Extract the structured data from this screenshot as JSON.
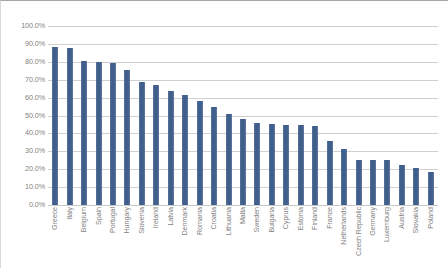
{
  "chart_data": {
    "type": "bar",
    "title": "",
    "subtitle": "",
    "xlabel": "",
    "ylabel": "",
    "ylim": [
      0,
      100
    ],
    "y_tick_labels": [
      "100.0%",
      "90.0%",
      "80.0%",
      "70.0%",
      "60.0%",
      "50.0%",
      "40.0%",
      "30.0%",
      "20.0%",
      "10.0%",
      "0.0%"
    ],
    "y_tick_values": [
      100,
      90,
      80,
      70,
      60,
      50,
      40,
      30,
      20,
      10,
      0
    ],
    "grid": true,
    "legend": "none",
    "bar_color": "#48648f",
    "categories": [
      "Greece",
      "Italy",
      "Belgium",
      "Spain",
      "Portugal",
      "Hungary",
      "Slovenia",
      "Ireland",
      "Latvia",
      "Denmark",
      "Romania",
      "Croatia",
      "Lithuania",
      "Malta",
      "Sweden",
      "Bulgaria",
      "Cyprus",
      "Estonia",
      "Finland",
      "France",
      "Netherlands",
      "Czech Republic",
      "Germany",
      "Luxemburg",
      "Austria",
      "Slovakia",
      "Poland"
    ],
    "values": [
      88.0,
      87.5,
      80.5,
      80.0,
      79.5,
      75.5,
      68.5,
      67.0,
      63.5,
      61.5,
      58.0,
      55.0,
      51.0,
      48.0,
      46.0,
      45.0,
      44.5,
      44.5,
      44.0,
      36.0,
      31.5,
      25.0,
      25.0,
      25.0,
      22.5,
      20.5,
      18.5
    ]
  }
}
